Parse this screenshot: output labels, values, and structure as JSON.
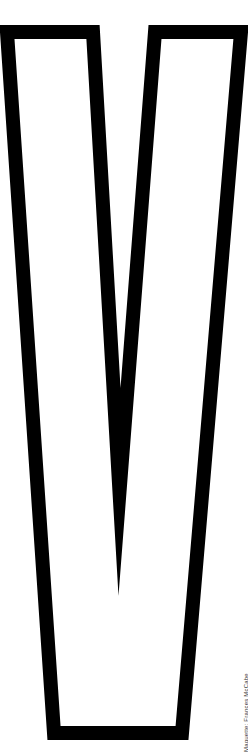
{
  "figure": {
    "letter": "V",
    "style": "outline",
    "stroke_color": "#000000",
    "fill_color": "#ffffff",
    "background": "#ffffff"
  },
  "credit": {
    "text": "Maquette: Frances McCabe"
  }
}
